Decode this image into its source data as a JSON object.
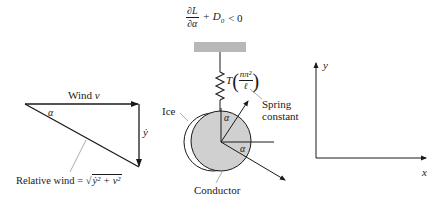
{
  "diagram": {
    "type": "conductor galloping free-body diagram",
    "condition": {
      "numerator": "∂L",
      "denominator": "∂α",
      "rest": "+ D",
      "subscript": "0",
      "inequality": "< 0"
    },
    "velocity_triangle": {
      "wind_label": "Wind",
      "wind_symbol": "v",
      "angle_symbol": "α",
      "ydot_label": "ẏ",
      "relative_wind_label": "Relative wind = ",
      "relative_wind_expr": "√(ẏ² + v²)",
      "sqrt_content": "ẏ² + v²"
    },
    "conductor": {
      "ice_label": "Ice",
      "conductor_label": "Conductor",
      "angle_top": "α",
      "angle_right": "α"
    },
    "spring": {
      "tension_symbol": "T",
      "fraction_num": "nπ²",
      "fraction_den": "ℓ",
      "label_line1": "Spring",
      "label_line2": "constant"
    },
    "axes": {
      "x_label": "x",
      "y_label": "y"
    },
    "colors": {
      "ink": "#1a1a1a",
      "conductor_fill": "#d0d0d0",
      "support_fill": "#b8b8b8",
      "leader_line": "#888888"
    }
  }
}
